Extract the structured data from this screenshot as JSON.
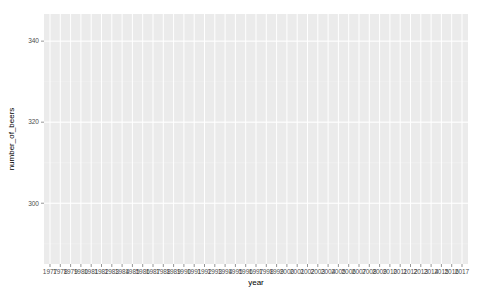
{
  "chart_data": {
    "type": "line",
    "title": "",
    "xlabel": "year",
    "ylabel": "number_of_beers",
    "x": [
      "1977",
      "1978",
      "1979",
      "1980",
      "1981",
      "1982",
      "1983",
      "1984",
      "1985",
      "1986",
      "1987",
      "1988",
      "1989",
      "1990",
      "1991",
      "1992",
      "1993",
      "1994",
      "1995",
      "1996",
      "1997",
      "1998",
      "1999",
      "2000",
      "2001",
      "2002",
      "2003",
      "2004",
      "2005",
      "2006",
      "2007",
      "2008",
      "2009",
      "2010",
      "2011",
      "2012",
      "2013",
      "2014",
      "2015",
      "2016",
      "2017"
    ],
    "series": [],
    "y_ticks": [
      300,
      320,
      340
    ],
    "ylim": [
      285,
      346.7
    ],
    "grid": true,
    "legend": "none",
    "colors": {
      "panel": "#ebebeb",
      "grid": "#ffffff",
      "text": "#4d4d4d"
    }
  }
}
